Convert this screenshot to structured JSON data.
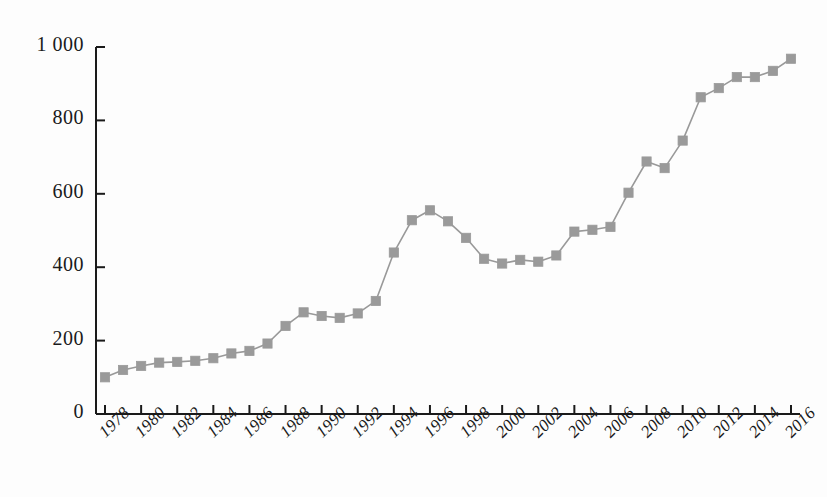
{
  "chart_data": {
    "type": "line",
    "title": "",
    "subtitle": "",
    "xlabel": "",
    "ylabel": "",
    "grid": false,
    "legend": false,
    "marker": "square",
    "line_color": "#999999",
    "marker_color": "#9a9a9a",
    "axis_color": "#1a1a1a",
    "xlim": [
      1977.5,
      2016.5
    ],
    "ylim": [
      0,
      1000
    ],
    "y_ticks": [
      0,
      200,
      400,
      600,
      800,
      1000
    ],
    "y_tick_labels": [
      "0",
      "200",
      "400",
      "600",
      "800",
      "1 000"
    ],
    "x_tick_labels": [
      "1978",
      "1980",
      "1982",
      "1984",
      "1986",
      "1988",
      "1990",
      "1992",
      "1994",
      "1996",
      "1998",
      "2000",
      "2002",
      "2004",
      "2006",
      "2008",
      "2010",
      "2012",
      "2014",
      "2016"
    ],
    "x": [
      1978,
      1979,
      1980,
      1981,
      1982,
      1983,
      1984,
      1985,
      1986,
      1987,
      1988,
      1989,
      1990,
      1991,
      1992,
      1993,
      1994,
      1995,
      1996,
      1997,
      1998,
      1999,
      2000,
      2001,
      2002,
      2003,
      2004,
      2005,
      2006,
      2007,
      2008,
      2009,
      2010,
      2011,
      2012,
      2013,
      2014,
      2015,
      2016
    ],
    "values": [
      100,
      120,
      131,
      140,
      142,
      145,
      152,
      165,
      172,
      192,
      240,
      277,
      267,
      262,
      274,
      308,
      440,
      528,
      555,
      525,
      480,
      423,
      410,
      420,
      415,
      432,
      497,
      502,
      510,
      603,
      688,
      670,
      745,
      863,
      888,
      918,
      918,
      935,
      968
    ],
    "series": [
      {
        "name": "value",
        "values": [
          100,
          120,
          131,
          140,
          142,
          145,
          152,
          165,
          172,
          192,
          240,
          277,
          267,
          262,
          274,
          308,
          440,
          528,
          555,
          525,
          480,
          423,
          410,
          420,
          415,
          432,
          497,
          502,
          510,
          603,
          688,
          670,
          745,
          863,
          888,
          918,
          918,
          935,
          968
        ]
      }
    ]
  }
}
